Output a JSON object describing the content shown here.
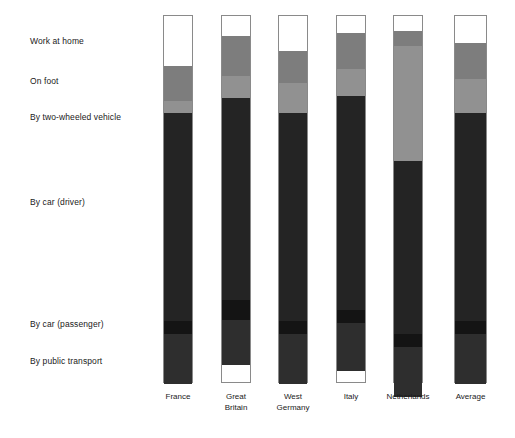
{
  "chart_data": {
    "type": "bar",
    "title": "",
    "subtitle": "",
    "xlabel": "",
    "ylabel": "",
    "stacked": true,
    "normalized_percent": true,
    "grid": false,
    "legend_position": "left-axis-labels",
    "ylim": [
      0,
      100
    ],
    "orientation": "vertical",
    "categories": [
      "France",
      "Great Britain",
      "West Germany",
      "Italy",
      "Netherlands",
      "Average"
    ],
    "category_labels_multiline": [
      "France",
      "Great\nBritain",
      "West\nGermany",
      "Italy",
      "Netherlands",
      "Average"
    ],
    "series": [
      {
        "name": "Work at home",
        "color": "#ffffff",
        "values": [
          13.6,
          5.4,
          9.5,
          4.6,
          4.1,
          7.3
        ]
      },
      {
        "name": "On foot",
        "color": "#7d7d7d",
        "values": [
          9.5,
          10.9,
          8.7,
          9.8,
          4.1,
          9.8
        ]
      },
      {
        "name": "By two-wheeled vehicle",
        "color": "#919191",
        "values": [
          3.3,
          6.0,
          8.2,
          7.3,
          31.2,
          9.2
        ]
      },
      {
        "name": "By car (driver)",
        "color": "#242424",
        "values": [
          56.5,
          54.9,
          56.5,
          58.2,
          47.0,
          56.5
        ]
      },
      {
        "name": "By car (passenger)",
        "color": "#141414",
        "values": [
          3.5,
          5.4,
          3.5,
          3.5,
          3.5,
          3.5
        ]
      },
      {
        "name": "By public transport",
        "color": "#2e2e2e",
        "values": [
          13.6,
          12.2,
          13.6,
          13.0,
          13.6,
          13.6
        ]
      }
    ]
  },
  "axis": {
    "category_labels": [
      {
        "text": "Work at home"
      },
      {
        "text": "On foot"
      },
      {
        "text": "By two-wheeled vehicle"
      },
      {
        "text": "By car (driver)"
      },
      {
        "text": "By car (passenger)"
      },
      {
        "text": "By public transport"
      }
    ],
    "tick_labels": [
      {
        "text": "France"
      },
      {
        "text": "Great\nBritain"
      },
      {
        "text": "West\nGermany"
      },
      {
        "text": "Italy"
      },
      {
        "text": "Netherlands"
      },
      {
        "text": "Average"
      }
    ]
  },
  "colors": {
    "background": "#ffffff",
    "bar_outline": "#8a8a8a",
    "text": "#1a1a1a"
  }
}
